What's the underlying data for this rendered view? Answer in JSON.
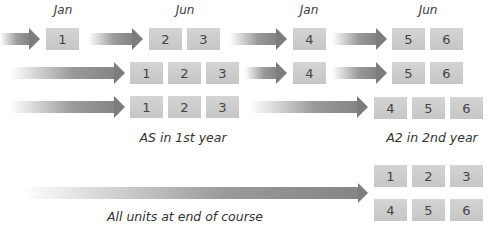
{
  "months": {
    "jan1": "Jan",
    "jun1": "Jun",
    "jan2": "Jan",
    "jun2": "Jun"
  },
  "rows": [
    {
      "units": [
        "1",
        "2",
        "3",
        "4",
        "5",
        "6"
      ]
    },
    {
      "units": [
        "1",
        "2",
        "3",
        "4",
        "5",
        "6"
      ]
    },
    {
      "units": [
        "1",
        "2",
        "3",
        "4",
        "5",
        "6"
      ]
    }
  ],
  "end_of_course": {
    "units": [
      "1",
      "2",
      "3",
      "4",
      "5",
      "6"
    ]
  },
  "captions": {
    "as_year": "AS in 1st year",
    "a2_year": "A2 in 2nd year",
    "all_units": "All units at end of course"
  },
  "colors": {
    "box": "#cccccc",
    "arrow": "#808080",
    "text": "#3a3a3a"
  }
}
